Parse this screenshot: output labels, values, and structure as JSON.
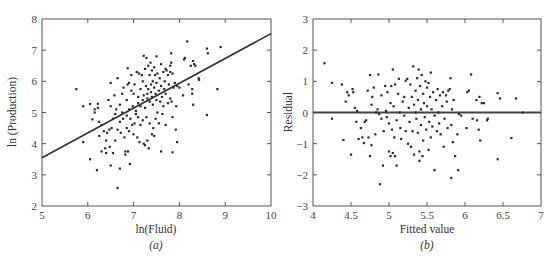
{
  "chart_data": [
    {
      "type": "scatter",
      "panel": "a",
      "caption": "(a)",
      "title": "",
      "xlabel": "ln(Fluid)",
      "ylabel": "ln (Production)",
      "xlim": [
        5,
        10
      ],
      "ylim": [
        2,
        8
      ],
      "xticks": [
        5,
        6,
        7,
        8,
        9,
        10
      ],
      "yticks": [
        2,
        3,
        4,
        5,
        6,
        7,
        8
      ],
      "grid": false,
      "legend": null,
      "fit_line": {
        "x": [
          5,
          10
        ],
        "y": [
          3.55,
          7.53
        ]
      },
      "points": [
        [
          5.75,
          5.75
        ],
        [
          5.9,
          5.2
        ],
        [
          5.9,
          4.05
        ],
        [
          6.05,
          5.27
        ],
        [
          6.05,
          3.5
        ],
        [
          6.1,
          4.78
        ],
        [
          6.15,
          5.1
        ],
        [
          6.15,
          5.0
        ],
        [
          6.2,
          3.15
        ],
        [
          6.22,
          5.28
        ],
        [
          6.22,
          5.15
        ],
        [
          6.25,
          4.7
        ],
        [
          6.25,
          4.25
        ],
        [
          6.3,
          3.75
        ],
        [
          6.3,
          4.6
        ],
        [
          6.35,
          4.4
        ],
        [
          6.38,
          3.85
        ],
        [
          6.4,
          4.1
        ],
        [
          6.4,
          3.7
        ],
        [
          6.42,
          4.35
        ],
        [
          6.45,
          5.4
        ],
        [
          6.47,
          4.45
        ],
        [
          6.48,
          3.9
        ],
        [
          6.5,
          5.95
        ],
        [
          6.5,
          5.2
        ],
        [
          6.5,
          3.3
        ],
        [
          6.52,
          4.5
        ],
        [
          6.55,
          4.8
        ],
        [
          6.55,
          3.7
        ],
        [
          6.58,
          5.55
        ],
        [
          6.6,
          4.95
        ],
        [
          6.6,
          4.1
        ],
        [
          6.62,
          5.1
        ],
        [
          6.65,
          6.1
        ],
        [
          6.65,
          4.45
        ],
        [
          6.65,
          2.58
        ],
        [
          6.7,
          4.7
        ],
        [
          6.7,
          5.25
        ],
        [
          6.7,
          3.2
        ],
        [
          6.72,
          4.35
        ],
        [
          6.75,
          5.6
        ],
        [
          6.75,
          5.0
        ],
        [
          6.77,
          4.8
        ],
        [
          6.78,
          5.8
        ],
        [
          6.8,
          4.2
        ],
        [
          6.82,
          3.75
        ],
        [
          6.82,
          3.65
        ],
        [
          6.85,
          5.4
        ],
        [
          6.85,
          4.9
        ],
        [
          6.85,
          4.5
        ],
        [
          6.87,
          6.42
        ],
        [
          6.87,
          5.9
        ],
        [
          6.88,
          3.75
        ],
        [
          6.9,
          5.95
        ],
        [
          6.9,
          5.1
        ],
        [
          6.9,
          4.4
        ],
        [
          6.92,
          3.35
        ],
        [
          6.93,
          4.8
        ],
        [
          6.95,
          6.2
        ],
        [
          6.95,
          5.7
        ],
        [
          6.97,
          4.6
        ],
        [
          6.98,
          5.2
        ],
        [
          7.0,
          5.6
        ],
        [
          7.0,
          4.3
        ],
        [
          7.02,
          5.9
        ],
        [
          7.02,
          4.65
        ],
        [
          7.05,
          5.05
        ],
        [
          7.05,
          4.95
        ],
        [
          7.07,
          6.3
        ],
        [
          7.08,
          4.2
        ],
        [
          7.1,
          5.5
        ],
        [
          7.1,
          5.3
        ],
        [
          7.1,
          4.85
        ],
        [
          7.12,
          6.25
        ],
        [
          7.13,
          4.05
        ],
        [
          7.15,
          5.75
        ],
        [
          7.15,
          5.2
        ],
        [
          7.15,
          4.6
        ],
        [
          7.18,
          6.2
        ],
        [
          7.2,
          6.0
        ],
        [
          7.2,
          5.4
        ],
        [
          7.2,
          4.75
        ],
        [
          7.22,
          6.82
        ],
        [
          7.22,
          5.55
        ],
        [
          7.22,
          4.0
        ],
        [
          7.25,
          6.4
        ],
        [
          7.25,
          5.15
        ],
        [
          7.25,
          3.95
        ],
        [
          7.27,
          5.85
        ],
        [
          7.28,
          6.75
        ],
        [
          7.28,
          4.85
        ],
        [
          7.3,
          5.6
        ],
        [
          7.3,
          5.45
        ],
        [
          7.3,
          4.1
        ],
        [
          7.32,
          6.5
        ],
        [
          7.32,
          5.75
        ],
        [
          7.33,
          3.85
        ],
        [
          7.35,
          6.2
        ],
        [
          7.35,
          5.35
        ],
        [
          7.35,
          4.65
        ],
        [
          7.37,
          6.6
        ],
        [
          7.38,
          5.9
        ],
        [
          7.38,
          5.65
        ],
        [
          7.4,
          6.35
        ],
        [
          7.4,
          5.5
        ],
        [
          7.4,
          4.3
        ],
        [
          7.42,
          6.0
        ],
        [
          7.42,
          5.25
        ],
        [
          7.43,
          4.5
        ],
        [
          7.45,
          6.45
        ],
        [
          7.45,
          5.8
        ],
        [
          7.45,
          4.25
        ],
        [
          7.47,
          6.2
        ],
        [
          7.48,
          5.6
        ],
        [
          7.48,
          4.8
        ],
        [
          7.5,
          6.8
        ],
        [
          7.5,
          5.95
        ],
        [
          7.5,
          5.4
        ],
        [
          7.52,
          6.25
        ],
        [
          7.52,
          5.0
        ],
        [
          7.55,
          5.7
        ],
        [
          7.55,
          4.65
        ],
        [
          7.57,
          6.1
        ],
        [
          7.58,
          5.35
        ],
        [
          7.6,
          6.55
        ],
        [
          7.6,
          5.85
        ],
        [
          7.6,
          3.75
        ],
        [
          7.62,
          5.5
        ],
        [
          7.63,
          4.95
        ],
        [
          7.65,
          6.3
        ],
        [
          7.65,
          5.2
        ],
        [
          7.67,
          5.75
        ],
        [
          7.68,
          6.0
        ],
        [
          7.7,
          6.4
        ],
        [
          7.7,
          5.6
        ],
        [
          7.7,
          4.6
        ],
        [
          7.72,
          6.35
        ],
        [
          7.75,
          6.2
        ],
        [
          7.75,
          5.3
        ],
        [
          7.77,
          5.9
        ],
        [
          7.8,
          6.5
        ],
        [
          7.8,
          6.3
        ],
        [
          7.8,
          5.45
        ],
        [
          7.82,
          6.9
        ],
        [
          7.82,
          6.6
        ],
        [
          7.83,
          5.35
        ],
        [
          7.85,
          6.25
        ],
        [
          7.85,
          4.85
        ],
        [
          7.85,
          3.72
        ],
        [
          7.87,
          5.8
        ],
        [
          7.9,
          5.95
        ],
        [
          7.92,
          4.45
        ],
        [
          7.93,
          5.2
        ],
        [
          7.95,
          5.85
        ],
        [
          7.95,
          4.05
        ],
        [
          8.0,
          5.8
        ],
        [
          8.08,
          5.55
        ],
        [
          8.1,
          6.7
        ],
        [
          8.12,
          6.75
        ],
        [
          8.17,
          7.28
        ],
        [
          8.2,
          5.9
        ],
        [
          8.25,
          6.5
        ],
        [
          8.28,
          5.75
        ],
        [
          8.28,
          5.6
        ],
        [
          8.3,
          6.65
        ],
        [
          8.3,
          5.25
        ],
        [
          8.32,
          6.55
        ],
        [
          8.35,
          6.5
        ],
        [
          8.42,
          6.1
        ],
        [
          8.43,
          6.05
        ],
        [
          8.6,
          7.05
        ],
        [
          8.6,
          4.92
        ],
        [
          8.62,
          6.9
        ],
        [
          8.83,
          5.75
        ],
        [
          8.9,
          7.1
        ]
      ]
    },
    {
      "type": "scatter",
      "panel": "b",
      "caption": "(b)",
      "title": "",
      "xlabel": "Fitted value",
      "ylabel": "Residual",
      "xlim": [
        4,
        7
      ],
      "ylim": [
        -3,
        3
      ],
      "xticks": [
        4,
        4.5,
        5,
        5.5,
        6,
        6.5,
        7
      ],
      "yticks": [
        -3,
        -2,
        -1,
        0,
        1,
        2,
        3
      ],
      "grid": false,
      "legend": null,
      "reference_line": {
        "y": 0
      },
      "points": [
        [
          4.15,
          1.58
        ],
        [
          4.25,
          0.95
        ],
        [
          4.25,
          -0.2
        ],
        [
          4.38,
          0.9
        ],
        [
          4.4,
          -0.88
        ],
        [
          4.43,
          0.35
        ],
        [
          4.45,
          0.65
        ],
        [
          4.47,
          0.55
        ],
        [
          4.5,
          -1.35
        ],
        [
          4.52,
          0.75
        ],
        [
          4.53,
          0.65
        ],
        [
          4.55,
          0.15
        ],
        [
          4.57,
          -0.3
        ],
        [
          4.58,
          0.05
        ],
        [
          4.6,
          -0.85
        ],
        [
          4.63,
          -0.5
        ],
        [
          4.65,
          -0.8
        ],
        [
          4.67,
          -0.98
        ],
        [
          4.68,
          -0.3
        ],
        [
          4.7,
          -0.25
        ],
        [
          4.72,
          0.7
        ],
        [
          4.73,
          -0.8
        ],
        [
          4.75,
          1.2
        ],
        [
          4.75,
          -1.4
        ],
        [
          4.77,
          0.25
        ],
        [
          4.77,
          -1.05
        ],
        [
          4.78,
          0.5
        ],
        [
          4.8,
          0.8
        ],
        [
          4.82,
          -0.7
        ],
        [
          4.83,
          0.0
        ],
        [
          4.85,
          0.1
        ],
        [
          4.86,
          1.22
        ],
        [
          4.87,
          -0.05
        ],
        [
          4.88,
          -2.3
        ],
        [
          4.9,
          -0.2
        ],
        [
          4.9,
          0.55
        ],
        [
          4.92,
          -1.7
        ],
        [
          4.93,
          -0.6
        ],
        [
          4.95,
          0.85
        ],
        [
          4.96,
          0.05
        ],
        [
          4.97,
          -0.15
        ],
        [
          4.98,
          0.65
        ],
        [
          5.0,
          -1.25
        ],
        [
          5.0,
          -0.35
        ],
        [
          5.02,
          0.3
        ],
        [
          5.02,
          -1.4
        ],
        [
          5.03,
          0.85
        ],
        [
          5.04,
          -0.55
        ],
        [
          5.05,
          1.38
        ],
        [
          5.05,
          -1.3
        ],
        [
          5.06,
          0.2
        ],
        [
          5.07,
          -0.8
        ],
        [
          5.08,
          0.9
        ],
        [
          5.08,
          -1.4
        ],
        [
          5.1,
          -1.7
        ],
        [
          5.1,
          -0.25
        ],
        [
          5.12,
          0.6
        ],
        [
          5.13,
          1.08
        ],
        [
          5.14,
          0.0
        ],
        [
          5.15,
          -0.5
        ],
        [
          5.16,
          -0.85
        ],
        [
          5.18,
          0.35
        ],
        [
          5.2,
          -0.1
        ],
        [
          5.2,
          0.5
        ],
        [
          5.22,
          1.02
        ],
        [
          5.22,
          -0.6
        ],
        [
          5.24,
          1.08
        ],
        [
          5.25,
          -1.0
        ],
        [
          5.26,
          0.15
        ],
        [
          5.27,
          -0.3
        ],
        [
          5.28,
          0.9
        ],
        [
          5.29,
          -1.1
        ],
        [
          5.3,
          0.5
        ],
        [
          5.31,
          -0.6
        ],
        [
          5.32,
          1.48
        ],
        [
          5.33,
          0.25
        ],
        [
          5.33,
          -1.35
        ],
        [
          5.35,
          0.7
        ],
        [
          5.35,
          0.0
        ],
        [
          5.36,
          -0.2
        ],
        [
          5.37,
          1.1
        ],
        [
          5.38,
          0.4
        ],
        [
          5.38,
          -0.65
        ],
        [
          5.39,
          1.38
        ],
        [
          5.4,
          -1.25
        ],
        [
          5.4,
          -1.55
        ],
        [
          5.41,
          0.85
        ],
        [
          5.42,
          0.1
        ],
        [
          5.42,
          -0.4
        ],
        [
          5.43,
          1.2
        ],
        [
          5.44,
          -1.4
        ],
        [
          5.45,
          0.6
        ],
        [
          5.45,
          -0.9
        ],
        [
          5.46,
          0.3
        ],
        [
          5.47,
          -0.15
        ],
        [
          5.48,
          1.0
        ],
        [
          5.49,
          -0.55
        ],
        [
          5.5,
          0.8
        ],
        [
          5.5,
          0.2
        ],
        [
          5.52,
          0.95
        ],
        [
          5.52,
          -1.2
        ],
        [
          5.53,
          -0.3
        ],
        [
          5.54,
          0.5
        ],
        [
          5.55,
          1.28
        ],
        [
          5.55,
          -0.8
        ],
        [
          5.56,
          0.1
        ],
        [
          5.57,
          -0.45
        ],
        [
          5.58,
          0.65
        ],
        [
          5.6,
          -0.1
        ],
        [
          5.6,
          -1.85
        ],
        [
          5.62,
          0.4
        ],
        [
          5.63,
          -0.6
        ],
        [
          5.64,
          0.75
        ],
        [
          5.65,
          0.0
        ],
        [
          5.66,
          -0.35
        ],
        [
          5.67,
          0.55
        ],
        [
          5.68,
          -0.7
        ],
        [
          5.7,
          0.2
        ],
        [
          5.71,
          0.65
        ],
        [
          5.72,
          -1.1
        ],
        [
          5.73,
          -0.2
        ],
        [
          5.75,
          0.55
        ],
        [
          5.76,
          0.35
        ],
        [
          5.77,
          -0.5
        ],
        [
          5.78,
          0.7
        ],
        [
          5.8,
          0.75
        ],
        [
          5.81,
          1.1
        ],
        [
          5.82,
          -0.4
        ],
        [
          5.82,
          -2.1
        ],
        [
          5.83,
          0.1
        ],
        [
          5.84,
          -0.95
        ],
        [
          5.85,
          0.4
        ],
        [
          5.87,
          -1.4
        ],
        [
          5.9,
          -0.7
        ],
        [
          5.91,
          -1.85
        ],
        [
          5.92,
          -0.05
        ],
        [
          5.95,
          -0.1
        ],
        [
          6.02,
          -0.5
        ],
        [
          6.03,
          0.65
        ],
        [
          6.05,
          0.7
        ],
        [
          6.08,
          1.22
        ],
        [
          6.1,
          -0.2
        ],
        [
          6.15,
          0.4
        ],
        [
          6.16,
          -0.25
        ],
        [
          6.18,
          -0.55
        ],
        [
          6.19,
          0.5
        ],
        [
          6.2,
          -0.9
        ],
        [
          6.22,
          0.3
        ],
        [
          6.25,
          0.3
        ],
        [
          6.29,
          -0.25
        ],
        [
          6.3,
          -0.2
        ],
        [
          6.43,
          0.62
        ],
        [
          6.43,
          -1.5
        ],
        [
          6.46,
          0.45
        ],
        [
          6.61,
          -0.82
        ],
        [
          6.67,
          0.45
        ],
        [
          6.76,
          0.0
        ]
      ]
    }
  ],
  "panels": {
    "a": {
      "caption": "(a)",
      "xlabel": "ln(Fluid)",
      "ylabel": "ln (Production)"
    },
    "b": {
      "caption": "(b)",
      "xlabel": "Fitted value",
      "ylabel": "Residual"
    }
  }
}
